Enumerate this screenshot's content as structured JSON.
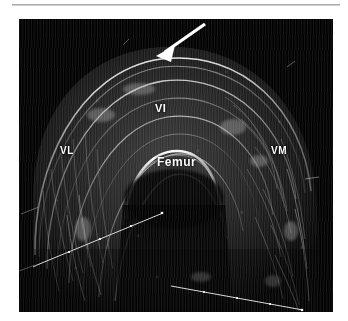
{
  "figure": {
    "modality": "panoramic-ultrasound",
    "region": "anterior-thigh-transverse",
    "background_color": "#ffffff",
    "scan_background_color": "#000000",
    "annotation_color": "#ffffff"
  },
  "annotations": [
    {
      "id": "vi",
      "label": "VI",
      "name": "annotation-vastus-intermedius"
    },
    {
      "id": "vl",
      "label": "VL",
      "name": "annotation-vastus-lateralis"
    },
    {
      "id": "vm",
      "label": "VM",
      "name": "annotation-vastus-medialis"
    },
    {
      "id": "femur",
      "label": "Femur",
      "name": "annotation-femur"
    }
  ],
  "markers": {
    "arrow": {
      "name": "pointer-arrow",
      "color": "#ffffff",
      "tail_x": 186,
      "tail_y": 24,
      "tip_x": 156,
      "tip_y": 56
    }
  },
  "scale_lines": [
    {
      "name": "scale-line-lower-left",
      "x1": 37,
      "y1": 265,
      "x2": 163,
      "y2": 213,
      "ticks": 4
    },
    {
      "name": "scale-line-lower-right",
      "x1": 171,
      "y1": 286,
      "x2": 303,
      "y2": 310,
      "ticks": 4
    }
  ]
}
